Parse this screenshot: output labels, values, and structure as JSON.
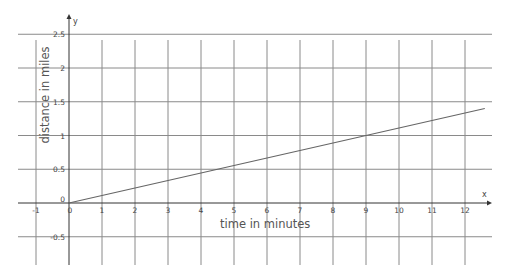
{
  "chart_data": {
    "type": "line",
    "title": "",
    "xlabel": "time in minutes",
    "ylabel": "distance in miles",
    "x_axis_name": "x",
    "y_axis_name": "y",
    "xlim": [
      -1.5,
      12.8
    ],
    "ylim": [
      -0.8,
      2.75
    ],
    "grid": true,
    "x_ticks": [
      -1,
      0,
      1,
      2,
      3,
      4,
      5,
      6,
      7,
      8,
      9,
      10,
      11,
      12
    ],
    "y_ticks": [
      -0.5,
      0,
      0.5,
      1,
      1.5,
      2,
      2.5
    ],
    "x_tick_labels": [
      "-1",
      "0",
      "1",
      "2",
      "3",
      "4",
      "5",
      "6",
      "7",
      "8",
      "9",
      "10",
      "11",
      "12"
    ],
    "y_tick_labels": [
      "-0.5",
      "0",
      "0.5",
      "1",
      "1.5",
      "2",
      "2.5"
    ],
    "series": [
      {
        "name": "distance vs time",
        "x": [
          0,
          9,
          12.6
        ],
        "y": [
          0,
          1,
          1.4
        ],
        "equation": "y = x/9",
        "color": "#666666"
      }
    ],
    "legend": null
  },
  "style": {
    "grid_color": "#8a8a8a",
    "axis_color": "#333333",
    "line_color": "#666666",
    "text_color": "#444444"
  }
}
